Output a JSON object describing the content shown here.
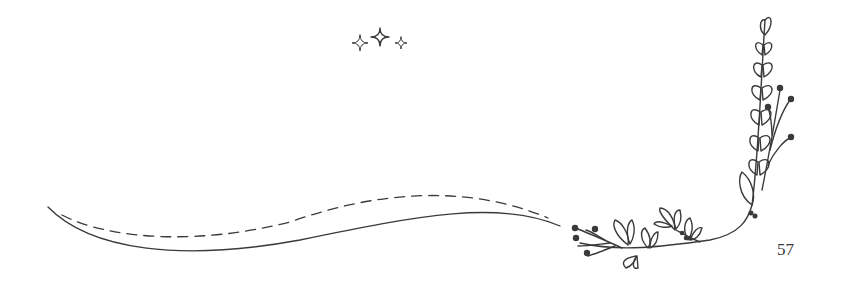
{
  "page": {
    "number": "57",
    "background": "#ffffff",
    "ink_color": "#3a3a3a"
  },
  "decorations": {
    "sparkles": [
      "small-sparkle-icon",
      "large-sparkle-icon",
      "small-sparkle-icon"
    ],
    "swoosh": [
      "solid-curve",
      "dashed-curve"
    ],
    "floral_branch": "corner-floral-branch-icon"
  }
}
